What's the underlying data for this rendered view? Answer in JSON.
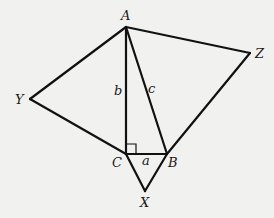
{
  "diagram": {
    "type": "geometry",
    "colors": {
      "background": "#f1f1ef",
      "stroke": "#111111",
      "text": "#1a1a1a"
    },
    "points": {
      "A": {
        "x": 126,
        "y": 27
      },
      "B": {
        "x": 167,
        "y": 154
      },
      "C": {
        "x": 126,
        "y": 154
      },
      "X": {
        "x": 145,
        "y": 191
      },
      "Y": {
        "x": 30,
        "y": 99
      },
      "Z": {
        "x": 250,
        "y": 53
      }
    },
    "vertex_labels": {
      "A": "A",
      "B": "B",
      "C": "C",
      "X": "X",
      "Y": "Y",
      "Z": "Z"
    },
    "side_labels": {
      "a": "a",
      "b": "b",
      "c": "c"
    },
    "right_angle": {
      "vertex": "C",
      "size": 10
    }
  }
}
